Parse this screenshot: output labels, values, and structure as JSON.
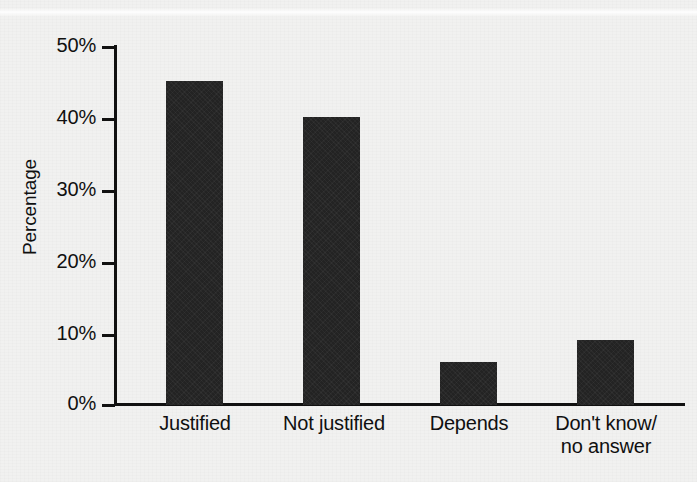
{
  "chart_data": {
    "type": "bar",
    "title": "",
    "xlabel": "",
    "ylabel": "Percentage",
    "categories": [
      "Justified",
      "Not justified",
      "Depends",
      "Don't know/\nno answer"
    ],
    "category_lines": [
      [
        "Justified"
      ],
      [
        "Not justified"
      ],
      [
        "Depends"
      ],
      [
        "Don't know/",
        "no answer"
      ]
    ],
    "values": [
      45,
      40,
      6,
      9
    ],
    "ylim": [
      0,
      50
    ],
    "yticks": [
      0,
      10,
      20,
      30,
      40,
      50
    ],
    "ytick_labels": [
      "0%",
      "10%",
      "20%",
      "30%",
      "40%",
      "50%"
    ],
    "grid": false,
    "legend": false,
    "bar_color": "#232323",
    "axis_color": "#111111",
    "background_color": "#f1f1f0"
  },
  "axis": {
    "y_title": "Percentage",
    "ticks": [
      {
        "label": "50%",
        "value": 50
      },
      {
        "label": "40%",
        "value": 40
      },
      {
        "label": "30%",
        "value": 30
      },
      {
        "label": "20%",
        "value": 20
      },
      {
        "label": "10%",
        "value": 10
      },
      {
        "label": "0%",
        "value": 0
      }
    ]
  },
  "bars": [
    {
      "label_line1": "Justified",
      "label_line2": "",
      "value": 45
    },
    {
      "label_line1": "Not justified",
      "label_line2": "",
      "value": 40
    },
    {
      "label_line1": "Depends",
      "label_line2": "",
      "value": 6
    },
    {
      "label_line1": "Don't know/",
      "label_line2": "no answer",
      "value": 9
    }
  ]
}
